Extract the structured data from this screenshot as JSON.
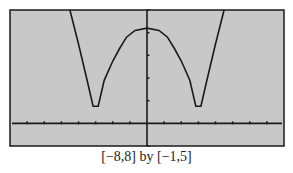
{
  "chart_data": {
    "type": "line",
    "title": "",
    "caption": "[−8,8] by [−1,5]",
    "xlabel": "",
    "ylabel": "",
    "xlim": [
      -8,
      8
    ],
    "ylim": [
      -1,
      5
    ],
    "xscale_tick": 1,
    "yscale_tick": 1,
    "grid": false,
    "background": "#c8c8c8",
    "frame_color": "#1a1a1a",
    "curve_color": "#1a1a1a",
    "series": [
      {
        "name": "y = f(x)",
        "x": [
          -4.5,
          -4.0,
          -3.5,
          -3.15,
          -2.85,
          -2.5,
          -2.0,
          -1.6,
          -1.2,
          -0.7,
          0,
          0.7,
          1.2,
          1.6,
          2.0,
          2.5,
          2.85,
          3.15,
          3.5,
          4.0,
          4.5
        ],
        "y": [
          5.0,
          3.5,
          1.9,
          0.75,
          0.75,
          1.9,
          2.75,
          3.3,
          3.8,
          4.1,
          4.2,
          4.1,
          3.8,
          3.3,
          2.75,
          1.9,
          0.75,
          0.75,
          1.9,
          3.5,
          5.0
        ]
      }
    ],
    "key_points": {
      "local_max": {
        "x": 0,
        "y": 4.2
      },
      "local_min_left": {
        "x": -3,
        "y": 0.75
      },
      "local_min_right": {
        "x": 3,
        "y": 0.75
      }
    }
  }
}
